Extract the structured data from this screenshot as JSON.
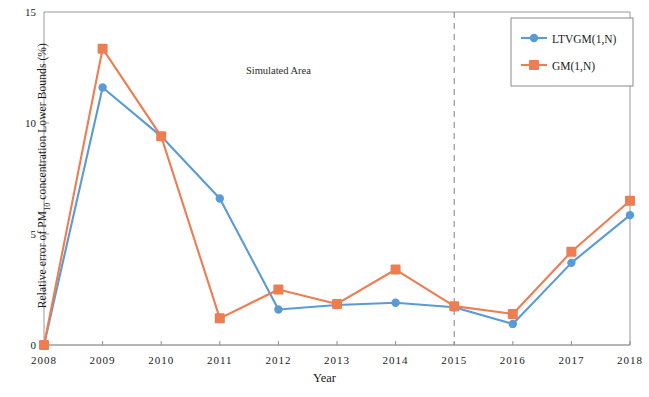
{
  "chart_data": {
    "type": "line",
    "title": "",
    "xlabel": "Year",
    "ylabel": "Relative error of PM10 concentration Lower Bounds (%)",
    "ylabel_prefix": "Relative error of PM",
    "ylabel_sub": "10",
    "ylabel_suffix": " concentration Lower Bounds (%)",
    "x": [
      2008,
      2009,
      2010,
      2011,
      2012,
      2013,
      2014,
      2015,
      2016,
      2017,
      2018
    ],
    "xtick_labels": [
      "2008",
      "2009",
      "2010",
      "2011",
      "2012",
      "2013",
      "2014",
      "2015",
      "2016",
      "2017",
      "2018"
    ],
    "ytick_labels": [
      "0",
      "5",
      "10",
      "15"
    ],
    "yticks": [
      0,
      5,
      10,
      15
    ],
    "ylim": [
      0,
      15
    ],
    "xlim": [
      2008,
      2018
    ],
    "grid": false,
    "legend_position": "top-right",
    "series": [
      {
        "name": "LTVGM(1,N)",
        "color": "#5b9bd5",
        "marker": "circle",
        "values": [
          0,
          11.6,
          9.4,
          6.6,
          1.6,
          1.8,
          1.9,
          1.7,
          0.95,
          3.7,
          5.85
        ]
      },
      {
        "name": "GM(1,N)",
        "color": "#ed7d52",
        "marker": "square",
        "values": [
          0,
          13.35,
          9.4,
          1.2,
          2.5,
          1.85,
          3.4,
          1.75,
          1.4,
          4.2,
          6.5
        ]
      }
    ],
    "annotations": [
      {
        "text": "Simulated  Area",
        "x": 2012,
        "y": 12.2
      },
      {
        "text": "Predicted  Area",
        "x": 2016.55,
        "y": 12.2
      }
    ],
    "divider": {
      "x": 2015,
      "style": "dashed",
      "color": "#8a8a8a"
    }
  }
}
